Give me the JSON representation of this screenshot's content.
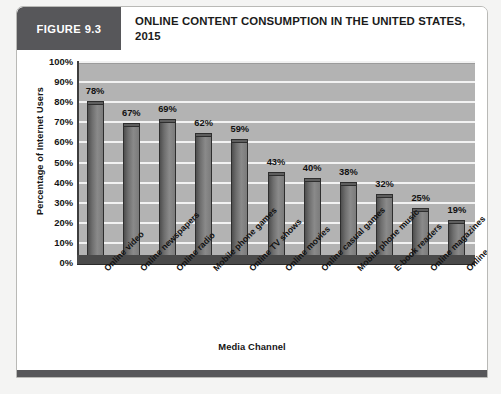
{
  "figure": {
    "number_label": "FIGURE 9.3",
    "title": "ONLINE CONTENT CONSUMPTION IN THE UNITED STATES, 2015"
  },
  "chart_data": {
    "type": "bar",
    "title": "ONLINE CONTENT CONSUMPTION IN THE UNITED STATES, 2015",
    "xlabel": "Media Channel",
    "ylabel": "Percentage of Internet Users",
    "ylim": [
      0,
      100
    ],
    "ytick_labels": [
      "100%",
      "90%",
      "80%",
      "70%",
      "60%",
      "50%",
      "40%",
      "30%",
      "20%",
      "10%",
      "0%"
    ],
    "ytick_values": [
      100,
      90,
      80,
      70,
      60,
      50,
      40,
      30,
      20,
      10,
      0
    ],
    "grid": true,
    "legend": false,
    "style": "3d-column",
    "bar_color": "#6e6e6e",
    "plot_background": "#b3b3b3",
    "gridline_color": "#f2f2f2",
    "categories": [
      "Online video",
      "Online newspapers",
      "Online radio",
      "Mobile phone games",
      "Online TV shows",
      "Online movies",
      "Online casual games",
      "Mobile phone music",
      "E-book readers",
      "Online magazines",
      "Online console games"
    ],
    "values": [
      78,
      67,
      69,
      62,
      59,
      43,
      40,
      38,
      32,
      25,
      19
    ],
    "data_labels": [
      "78%",
      "67%",
      "69%",
      "62%",
      "59%",
      "43%",
      "40%",
      "38%",
      "32%",
      "25%",
      "19%"
    ]
  }
}
